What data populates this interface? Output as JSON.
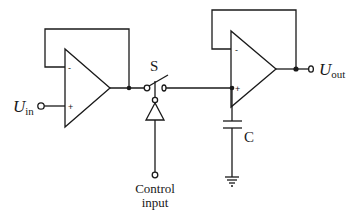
{
  "diagram": {
    "type": "sample-and-hold circuit",
    "labels": {
      "input_main": "U",
      "input_sub": "in",
      "output_main": "U",
      "output_sub": "out",
      "switch": "S",
      "capacitor": "C",
      "control_line1": "Control",
      "control_line2": "input",
      "opamp1_minus": "-",
      "opamp1_plus": "+",
      "opamp2_minus": "-",
      "opamp2_plus": "+"
    },
    "components": [
      {
        "id": "opamp-1",
        "kind": "op-amp",
        "role": "input voltage follower"
      },
      {
        "id": "switch-S",
        "kind": "analog switch"
      },
      {
        "id": "buffer",
        "kind": "control driver (inverter/buffer)"
      },
      {
        "id": "capacitor-C",
        "kind": "hold capacitor"
      },
      {
        "id": "ground",
        "kind": "ground"
      },
      {
        "id": "opamp-2",
        "kind": "op-amp",
        "role": "output voltage follower"
      }
    ],
    "colors": {
      "ink": "#1a1a1a",
      "background": "#ffffff"
    }
  }
}
